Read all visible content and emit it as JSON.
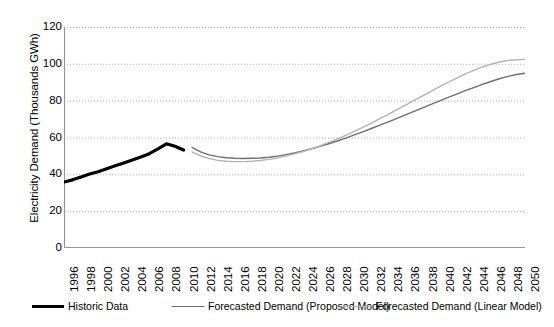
{
  "chart_data": {
    "type": "line",
    "title": "",
    "xlabel": "",
    "ylabel": "Electricity Demand (Thousands GWh)",
    "ylim": [
      0,
      120
    ],
    "ytick_step": 20,
    "yticks": [
      "120",
      "100",
      "80",
      "60",
      "40",
      "20",
      "0"
    ],
    "xlim": [
      1996,
      2050
    ],
    "grid": "horizontal-dotted",
    "legend_position": "bottom",
    "x": [
      1996,
      1998,
      2000,
      2002,
      2004,
      2006,
      2008,
      2010,
      2012,
      2014,
      2016,
      2018,
      2020,
      2022,
      2024,
      2026,
      2028,
      2030,
      2032,
      2034,
      2036,
      2038,
      2040,
      2042,
      2044,
      2046,
      2048,
      2050
    ],
    "xticks": [
      "1996",
      "1998",
      "2000",
      "2002",
      "2004",
      "2006",
      "2008",
      "2010",
      "2012",
      "2014",
      "2016",
      "2018",
      "2020",
      "2022",
      "2024",
      "2026",
      "2028",
      "2030",
      "2032",
      "2034",
      "2036",
      "2038",
      "2040",
      "2042",
      "2044",
      "2046",
      "2048",
      "2050"
    ],
    "series": [
      {
        "name": "Historic Data",
        "color": "#000000",
        "width": 3.2,
        "x": [
          1996,
          1997,
          1998,
          1999,
          2000,
          2001,
          2002,
          2003,
          2004,
          2005,
          2006,
          2007,
          2008,
          2009,
          2010
        ],
        "values": [
          35.8,
          37.0,
          38.6,
          40.2,
          41.4,
          43.0,
          44.6,
          46.2,
          47.8,
          49.4,
          51.2,
          53.8,
          56.6,
          55.2,
          53.2
        ]
      },
      {
        "name": "Forecasted Demand (Proposed Model)",
        "color": "#6e6e6e",
        "width": 1.4,
        "x": [
          2011,
          2012,
          2013,
          2014,
          2015,
          2016,
          2017,
          2018,
          2019,
          2020,
          2021,
          2022,
          2023,
          2024,
          2025,
          2026,
          2027,
          2028,
          2029,
          2030,
          2031,
          2032,
          2033,
          2034,
          2035,
          2036,
          2037,
          2038,
          2039,
          2040,
          2041,
          2042,
          2043,
          2044,
          2045,
          2046,
          2047,
          2048,
          2049,
          2050
        ],
        "values": [
          54.6,
          52.2,
          50.6,
          49.6,
          49.0,
          48.7,
          48.6,
          48.7,
          48.9,
          49.3,
          49.9,
          50.7,
          51.6,
          52.7,
          53.9,
          55.2,
          56.6,
          58.1,
          59.7,
          61.4,
          63.1,
          64.9,
          66.7,
          68.5,
          70.4,
          72.3,
          74.2,
          76.1,
          78.0,
          79.9,
          81.8,
          83.6,
          85.4,
          87.1,
          88.8,
          90.4,
          91.9,
          93.2,
          94.2,
          94.9
        ]
      },
      {
        "name": "Forecasted Demand (Linear Model)",
        "color": "#b4b4b4",
        "width": 1.4,
        "x": [
          2011,
          2012,
          2013,
          2014,
          2015,
          2016,
          2017,
          2018,
          2019,
          2020,
          2021,
          2022,
          2023,
          2024,
          2025,
          2026,
          2027,
          2028,
          2029,
          2030,
          2031,
          2032,
          2033,
          2034,
          2035,
          2036,
          2037,
          2038,
          2039,
          2040,
          2041,
          2042,
          2043,
          2044,
          2045,
          2046,
          2047,
          2048,
          2049,
          2050
        ],
        "values": [
          52.2,
          50.0,
          48.6,
          47.6,
          47.1,
          46.9,
          46.9,
          47.1,
          47.5,
          48.1,
          48.9,
          49.9,
          51.1,
          52.4,
          53.9,
          55.5,
          57.3,
          59.2,
          61.2,
          63.3,
          65.5,
          67.8,
          70.2,
          72.6,
          75.1,
          77.6,
          80.1,
          82.6,
          85.1,
          87.6,
          90.0,
          92.3,
          94.5,
          96.5,
          98.3,
          99.8,
          101.0,
          101.8,
          102.2,
          102.4
        ]
      }
    ]
  },
  "legend": {
    "items": [
      {
        "label": "Historic Data",
        "color": "#000000",
        "thickness": 3
      },
      {
        "label": "Forecasted Demand (Proposed Model)",
        "color": "#6e6e6e",
        "thickness": 1.5
      },
      {
        "label": "Forecasted Demand (Linear Model)",
        "color": "#b4b4b4",
        "thickness": 1.5
      }
    ]
  },
  "axes": {
    "axis_line_color": "#969696",
    "gridline_color": "#aaaaaa",
    "plot_background": "#ffffff"
  }
}
